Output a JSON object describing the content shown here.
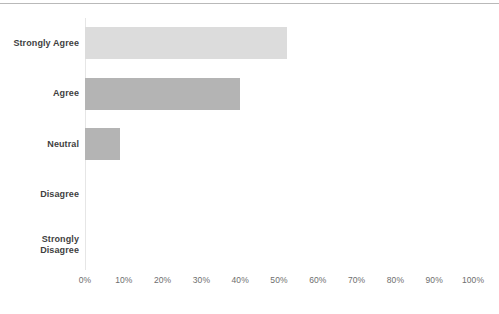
{
  "chart_data": {
    "type": "bar",
    "orientation": "horizontal",
    "title": "",
    "subtitle": "",
    "xlabel": "",
    "ylabel": "",
    "categories": [
      "Strongly Agree",
      "Agree",
      "Neutral",
      "Disagree",
      "Strongly Disagree"
    ],
    "values": [
      52,
      40,
      9,
      0,
      0
    ],
    "value_suffix": "%",
    "xlim": [
      0,
      100
    ],
    "xticks": [
      0,
      10,
      20,
      30,
      40,
      50,
      60,
      70,
      80,
      90,
      100
    ],
    "xtick_labels": [
      "0%",
      "10%",
      "20%",
      "30%",
      "40%",
      "50%",
      "60%",
      "70%",
      "80%",
      "90%",
      "100%"
    ],
    "grid": false,
    "legend": false,
    "legend_position": "none",
    "bar_colors": [
      "#dcdcdc",
      "#b4b4b4",
      "#b4b4b4",
      "#b4b4b4",
      "#b4b4b4"
    ],
    "series": [
      {
        "name": "Response share",
        "values": [
          52,
          40,
          9,
          0,
          0
        ]
      }
    ]
  },
  "style": {
    "background": "#ffffff",
    "label_color": "#3f3f3f",
    "tick_color": "#6e6e6e",
    "axis_color": "#e6e6e6",
    "rule_color": "#b9b9b9"
  }
}
